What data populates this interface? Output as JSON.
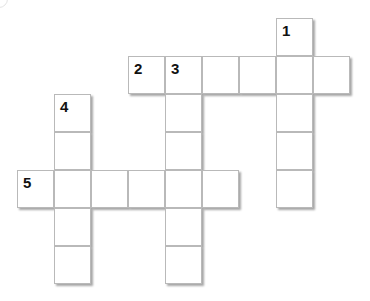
{
  "puzzle": {
    "cell_size": 37,
    "origin_x": 17,
    "origin_y": 18,
    "cells": [
      {
        "row": 0,
        "col": 7,
        "num": "1"
      },
      {
        "row": 1,
        "col": 3,
        "num": "2"
      },
      {
        "row": 1,
        "col": 4,
        "num": "3"
      },
      {
        "row": 1,
        "col": 5,
        "num": ""
      },
      {
        "row": 1,
        "col": 6,
        "num": ""
      },
      {
        "row": 1,
        "col": 7,
        "num": ""
      },
      {
        "row": 1,
        "col": 8,
        "num": ""
      },
      {
        "row": 2,
        "col": 1,
        "num": "4"
      },
      {
        "row": 2,
        "col": 4,
        "num": ""
      },
      {
        "row": 2,
        "col": 7,
        "num": ""
      },
      {
        "row": 3,
        "col": 1,
        "num": ""
      },
      {
        "row": 3,
        "col": 4,
        "num": ""
      },
      {
        "row": 3,
        "col": 7,
        "num": ""
      },
      {
        "row": 4,
        "col": 0,
        "num": "5"
      },
      {
        "row": 4,
        "col": 1,
        "num": ""
      },
      {
        "row": 4,
        "col": 2,
        "num": ""
      },
      {
        "row": 4,
        "col": 3,
        "num": ""
      },
      {
        "row": 4,
        "col": 4,
        "num": ""
      },
      {
        "row": 4,
        "col": 5,
        "num": ""
      },
      {
        "row": 4,
        "col": 7,
        "num": ""
      },
      {
        "row": 5,
        "col": 1,
        "num": ""
      },
      {
        "row": 5,
        "col": 4,
        "num": ""
      },
      {
        "row": 6,
        "col": 1,
        "num": ""
      },
      {
        "row": 6,
        "col": 4,
        "num": ""
      }
    ],
    "clue_numbers": [
      "1",
      "2",
      "3",
      "4",
      "5"
    ]
  }
}
